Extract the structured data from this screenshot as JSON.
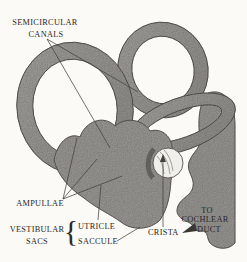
{
  "meta": {
    "type": "anatomical-line-diagram",
    "colors": {
      "background": "#fbfaf7",
      "structure_fill": "#a6a4a0",
      "structure_outline": "#5c5a56",
      "leader_line": "#44423e",
      "text": "#2c2824",
      "crista_fill": "#f1efe9"
    }
  },
  "labels": {
    "semicircular_canals": {
      "line1": "SEMICIRCULAR",
      "line2": "CANALS"
    },
    "ampullae": "AMPULLAE",
    "vestibular_sacs": {
      "line1": "VESTIBULAR",
      "line2": "SACS",
      "brace": "{"
    },
    "utricle": "UTRICLE",
    "saccule": "SACCULE",
    "crista": "CRISTA",
    "to_cochlear_duct": {
      "line1": "TO",
      "line2": "COCHLEAR",
      "line3": "DUCT"
    }
  }
}
